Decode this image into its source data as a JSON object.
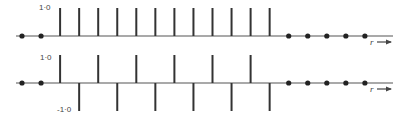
{
  "chart_data": [
    {
      "type": "stem",
      "title": "",
      "xlabel": "r",
      "ylabel": "",
      "y_tick_labels": [
        "1·0"
      ],
      "ylim": [
        0,
        1
      ],
      "x": [
        -2,
        -1,
        0,
        1,
        2,
        3,
        4,
        5,
        6,
        7,
        8,
        9,
        10,
        11,
        12,
        13,
        14,
        15,
        16
      ],
      "values": [
        0,
        0,
        1,
        1,
        1,
        1,
        1,
        1,
        1,
        1,
        1,
        1,
        1,
        1,
        0,
        0,
        0,
        0,
        0
      ],
      "description": "Rectangular sequence: 12 unit samples, zero elsewhere"
    },
    {
      "type": "stem",
      "title": "",
      "xlabel": "r",
      "ylabel": "",
      "y_tick_labels": [
        "1·0",
        "-1·0"
      ],
      "ylim": [
        -1,
        1
      ],
      "x": [
        -2,
        -1,
        0,
        1,
        2,
        3,
        4,
        5,
        6,
        7,
        8,
        9,
        10,
        11,
        12,
        13,
        14,
        15,
        16
      ],
      "values": [
        0,
        0,
        1,
        -1,
        1,
        -1,
        1,
        -1,
        1,
        -1,
        1,
        -1,
        1,
        -1,
        0,
        0,
        0,
        0,
        0
      ],
      "description": "Alternating sequence (+1,-1) over 12 samples, zero elsewhere"
    }
  ],
  "labels": {
    "top_y_max": "1·0",
    "bottom_y_max": "1·0",
    "bottom_y_min": "-1·0",
    "x_axis": "r"
  },
  "layout": {
    "x0": 22,
    "dx": 19.05,
    "top_axis_y": 36,
    "bottom_axis_y": 83,
    "stem_height": 28,
    "axis_x_start": 16,
    "axis_x_end": 393
  }
}
